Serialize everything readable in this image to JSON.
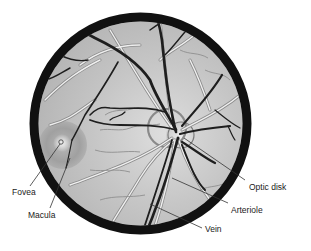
{
  "diagram": {
    "colors": {
      "background": "#ffffff",
      "fundus": "#bdbdbd",
      "rim": "#111111",
      "vein": "#1e1e1e",
      "arteriole": "#e8e8e8",
      "macula": "#9c9c9c",
      "label_text": "#1a1a1a",
      "leader_line": "#333333"
    },
    "labels": {
      "fovea": "Fovea",
      "macula": "Macula",
      "optic_disk": "Optic disk",
      "arteriole": "Arteriole",
      "vein": "Vein"
    },
    "caption": "Figure"
  }
}
